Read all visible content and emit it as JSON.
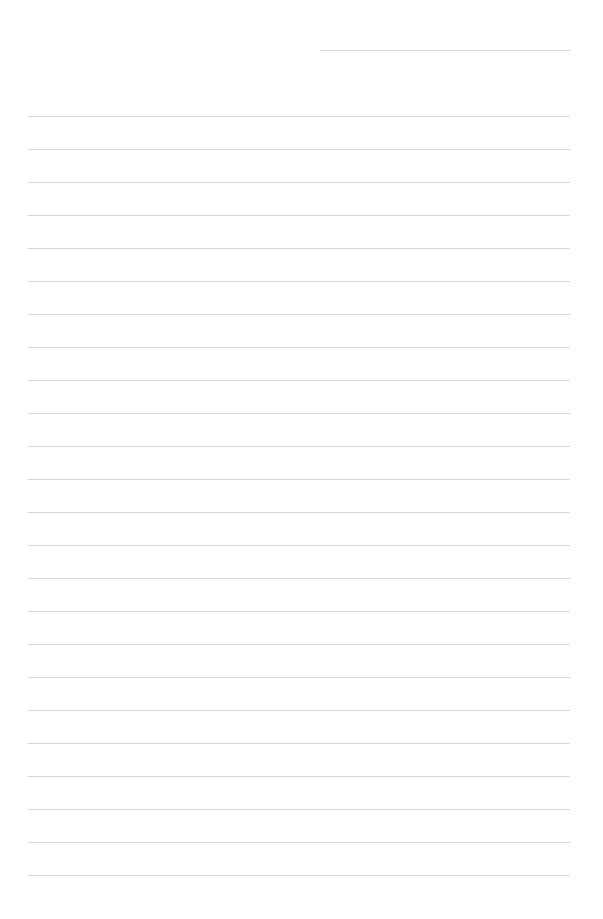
{
  "page": {
    "type": "lined-paper",
    "background_color": "#ffffff",
    "line_color": "#d8d8d8",
    "header_line": {
      "present": true
    },
    "rule_count": 24,
    "rules": [
      {
        "text": ""
      },
      {
        "text": ""
      },
      {
        "text": ""
      },
      {
        "text": ""
      },
      {
        "text": ""
      },
      {
        "text": ""
      },
      {
        "text": ""
      },
      {
        "text": ""
      },
      {
        "text": ""
      },
      {
        "text": ""
      },
      {
        "text": ""
      },
      {
        "text": ""
      },
      {
        "text": ""
      },
      {
        "text": ""
      },
      {
        "text": ""
      },
      {
        "text": ""
      },
      {
        "text": ""
      },
      {
        "text": ""
      },
      {
        "text": ""
      },
      {
        "text": ""
      },
      {
        "text": ""
      },
      {
        "text": ""
      },
      {
        "text": ""
      },
      {
        "text": ""
      }
    ]
  }
}
